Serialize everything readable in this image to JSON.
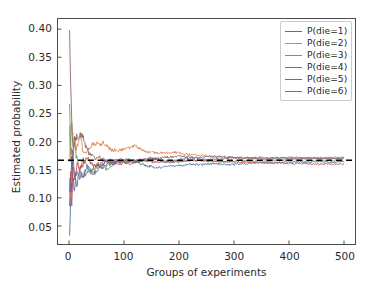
{
  "chart_data": {
    "type": "line",
    "title": "",
    "xlabel": "Groups of experiments",
    "ylabel": "Estimated probability",
    "xlim": [
      -20,
      520
    ],
    "ylim": [
      0.018,
      0.418
    ],
    "xticks": [
      0,
      100,
      200,
      300,
      400,
      500
    ],
    "xtick_labels": [
      "0",
      "100",
      "200",
      "300",
      "400",
      "500"
    ],
    "yticks": [
      0.05,
      0.1,
      0.15,
      0.2,
      0.25,
      0.3,
      0.35,
      0.4
    ],
    "ytick_labels": [
      "0.05",
      "0.10",
      "0.15",
      "0.20",
      "0.25",
      "0.30",
      "0.35",
      "0.40"
    ],
    "grid": false,
    "legend_position": "upper right",
    "reference_line": {
      "label": "1/6",
      "value": 0.1667,
      "style": "dashed",
      "color": "#000000"
    },
    "x": [
      1,
      2,
      3,
      4,
      5,
      6,
      7,
      8,
      9,
      10,
      12,
      14,
      16,
      18,
      20,
      23,
      26,
      29,
      32,
      36,
      40,
      45,
      50,
      56,
      62,
      68,
      75,
      82,
      90,
      100,
      110,
      120,
      130,
      140,
      150,
      160,
      175,
      190,
      205,
      220,
      235,
      250,
      265,
      280,
      295,
      310,
      325,
      340,
      355,
      370,
      385,
      400,
      415,
      430,
      445,
      460,
      475,
      490,
      500
    ],
    "series": [
      {
        "name": "P(die=1)",
        "color": "#4c72b0",
        "values": [
          0.033,
          0.061,
          0.1,
          0.128,
          0.122,
          0.16,
          0.131,
          0.142,
          0.118,
          0.108,
          0.135,
          0.12,
          0.131,
          0.141,
          0.149,
          0.14,
          0.133,
          0.147,
          0.155,
          0.152,
          0.147,
          0.155,
          0.16,
          0.153,
          0.159,
          0.164,
          0.167,
          0.163,
          0.164,
          0.166,
          0.169,
          0.165,
          0.161,
          0.157,
          0.156,
          0.154,
          0.155,
          0.157,
          0.158,
          0.16,
          0.159,
          0.16,
          0.161,
          0.16,
          0.159,
          0.16,
          0.161,
          0.162,
          0.163,
          0.162,
          0.163,
          0.163,
          0.164,
          0.163,
          0.164,
          0.164,
          0.163,
          0.164,
          0.164
        ]
      },
      {
        "name": "P(die=2)",
        "color": "#dd8452",
        "values": [
          0.228,
          0.164,
          0.192,
          0.205,
          0.232,
          0.215,
          0.206,
          0.189,
          0.194,
          0.21,
          0.196,
          0.186,
          0.193,
          0.203,
          0.212,
          0.197,
          0.181,
          0.177,
          0.18,
          0.189,
          0.193,
          0.196,
          0.197,
          0.194,
          0.198,
          0.193,
          0.186,
          0.185,
          0.185,
          0.186,
          0.189,
          0.193,
          0.187,
          0.182,
          0.181,
          0.18,
          0.18,
          0.181,
          0.179,
          0.177,
          0.176,
          0.175,
          0.173,
          0.172,
          0.172,
          0.171,
          0.17,
          0.17,
          0.169,
          0.169,
          0.168,
          0.169,
          0.169,
          0.17,
          0.17,
          0.17,
          0.17,
          0.17,
          0.17
        ]
      },
      {
        "name": "P(die=3)",
        "color": "#6f9e5b"
      },
      {
        "name": "P(die=4)",
        "color": "#c44e52"
      },
      {
        "name": "P(die=5)",
        "color": "#6b6a8f"
      },
      {
        "name": "P(die=6)",
        "color": "#8c6a63"
      }
    ],
    "series_values_3": [
      0.267,
      0.238,
      0.196,
      0.171,
      0.183,
      0.147,
      0.165,
      0.178,
      0.193,
      0.2,
      0.181,
      0.172,
      0.16,
      0.15,
      0.152,
      0.16,
      0.168,
      0.164,
      0.157,
      0.151,
      0.148,
      0.152,
      0.155,
      0.158,
      0.154,
      0.151,
      0.156,
      0.161,
      0.164,
      0.166,
      0.168,
      0.166,
      0.164,
      0.167,
      0.17,
      0.168,
      0.165,
      0.163,
      0.164,
      0.166,
      0.167,
      0.166,
      0.165,
      0.164,
      0.165,
      0.166,
      0.166,
      0.165,
      0.165,
      0.166,
      0.166,
      0.166,
      0.165,
      0.165,
      0.166,
      0.166,
      0.166,
      0.165,
      0.165
    ],
    "series_values_4": [
      0.085,
      0.12,
      0.147,
      0.113,
      0.097,
      0.126,
      0.143,
      0.157,
      0.14,
      0.128,
      0.141,
      0.158,
      0.167,
      0.159,
      0.15,
      0.155,
      0.162,
      0.168,
      0.172,
      0.168,
      0.163,
      0.16,
      0.158,
      0.161,
      0.164,
      0.166,
      0.163,
      0.161,
      0.16,
      0.162,
      0.164,
      0.166,
      0.168,
      0.166,
      0.164,
      0.163,
      0.164,
      0.165,
      0.166,
      0.167,
      0.167,
      0.166,
      0.165,
      0.165,
      0.164,
      0.164,
      0.163,
      0.163,
      0.162,
      0.162,
      0.162,
      0.161,
      0.161,
      0.161,
      0.16,
      0.16,
      0.16,
      0.16,
      0.16
    ],
    "series_values_5": [
      0.11,
      0.135,
      0.116,
      0.143,
      0.168,
      0.152,
      0.18,
      0.166,
      0.155,
      0.144,
      0.136,
      0.148,
      0.142,
      0.137,
      0.139,
      0.144,
      0.14,
      0.142,
      0.145,
      0.148,
      0.145,
      0.143,
      0.147,
      0.152,
      0.155,
      0.158,
      0.16,
      0.162,
      0.165,
      0.163,
      0.161,
      0.163,
      0.166,
      0.169,
      0.172,
      0.168,
      0.164,
      0.166,
      0.169,
      0.171,
      0.17,
      0.168,
      0.169,
      0.17,
      0.171,
      0.172,
      0.171,
      0.17,
      0.17,
      0.171,
      0.171,
      0.17,
      0.17,
      0.171,
      0.171,
      0.17,
      0.17,
      0.17,
      0.17
    ],
    "series_values_6": [
      0.398,
      0.347,
      0.302,
      0.262,
      0.23,
      0.212,
      0.196,
      0.184,
      0.2,
      0.21,
      0.204,
      0.212,
      0.205,
      0.212,
      0.208,
      0.215,
      0.207,
      0.196,
      0.188,
      0.18,
      0.176,
      0.172,
      0.17,
      0.172,
      0.168,
      0.166,
      0.164,
      0.166,
      0.168,
      0.167,
      0.165,
      0.164,
      0.166,
      0.168,
      0.169,
      0.17,
      0.172,
      0.173,
      0.174,
      0.173,
      0.172,
      0.173,
      0.174,
      0.173,
      0.172,
      0.171,
      0.171,
      0.172,
      0.172,
      0.171,
      0.171,
      0.172,
      0.172,
      0.171,
      0.171,
      0.171,
      0.172,
      0.172,
      0.172
    ]
  },
  "legend": {
    "items": [
      {
        "label": "P(die=1)"
      },
      {
        "label": "P(die=2)"
      },
      {
        "label": "P(die=3)"
      },
      {
        "label": "P(die=4)"
      },
      {
        "label": "P(die=5)"
      },
      {
        "label": "P(die=6)"
      }
    ]
  }
}
